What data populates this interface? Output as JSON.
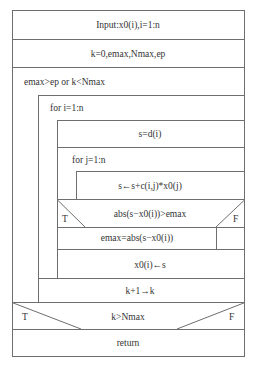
{
  "diagram": {
    "type": "nassi-shneiderman",
    "line_color": "#6e6e6e",
    "text_color": "#333333",
    "blocks": {
      "input": "Input:x0(i),i=1:n",
      "init": "k=0,emax,Nmax,ep",
      "while_condition": "emax>ep or k<Nmax",
      "for_i": "for i=1:n",
      "assign_s": "s=d(i)",
      "for_j": "for j=1:n",
      "accumulate": "s←s+c(i,j)*x0(j)",
      "if_condition": "abs(s−x0(i))>emax",
      "if_true_label": "T",
      "if_false_label": "F",
      "update_emax": "emax=abs(s−x0(i))",
      "update_x0": "x0(i)←s",
      "increment_k": "k+1→k",
      "final_condition": "k>Nmax",
      "final_true_label": "T",
      "final_false_label": "F",
      "return": "return"
    }
  }
}
